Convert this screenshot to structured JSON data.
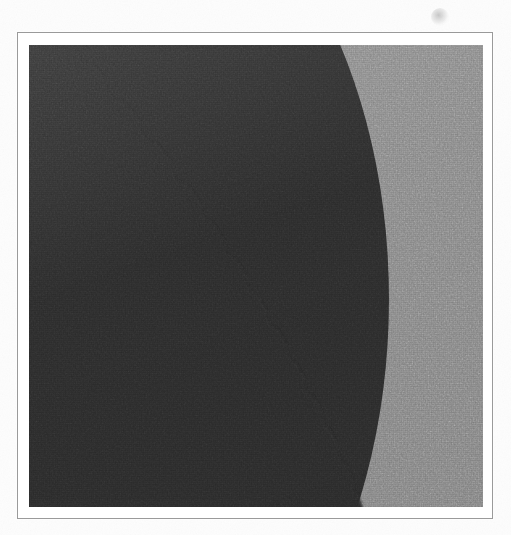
{
  "page": {
    "background_color": "#fdfdfd",
    "width": 511,
    "height": 535,
    "visible_text": ""
  },
  "frame": {
    "name": "printed rule border",
    "border_color": "#9a9a9a",
    "matte_color": "#ffffff",
    "left": 17,
    "top": 32,
    "width": 476,
    "height": 487
  },
  "plate": {
    "name": "halftone image plate",
    "left": 11,
    "top": 12,
    "width": 454,
    "height": 462,
    "light_tone_color": "#8b8b8b",
    "dark_tone_color": "#2d2d2d",
    "texture": "halftone-dot-screen"
  },
  "artifacts": [
    {
      "name": "ink-smudge",
      "left": 431,
      "top": 8,
      "width": 18,
      "height": 18,
      "color": "#787878"
    }
  ],
  "chart_data": {
    "type": "area",
    "title": "",
    "subtitle": "",
    "xlabel": "",
    "ylabel": "",
    "grid": false,
    "legend_position": "none",
    "description": "Two-tone halftone field: a dark region occupies the left side, bounded on the right by a smooth concave curve that sweeps from the upper-left down to the lower-right; the remaining area is a uniform light gray.",
    "xlim": [
      0,
      454
    ],
    "ylim": [
      0,
      462
    ],
    "series": [
      {
        "name": "dark-region-boundary",
        "fill_side": "left",
        "fill_color": "#2d2d2d",
        "x": [
          47,
          77,
          112,
          144,
          172,
          196,
          218,
          239,
          258,
          276,
          293,
          309,
          324,
          334
        ],
        "y": [
          0,
          35,
          77,
          119,
          158,
          196,
          231,
          267,
          300,
          334,
          367,
          400,
          435,
          462
        ]
      },
      {
        "name": "light-region",
        "fill_side": "right",
        "fill_color": "#8b8b8b"
      }
    ],
    "tick_labels_x": [],
    "tick_labels_y": [],
    "annotations": []
  }
}
